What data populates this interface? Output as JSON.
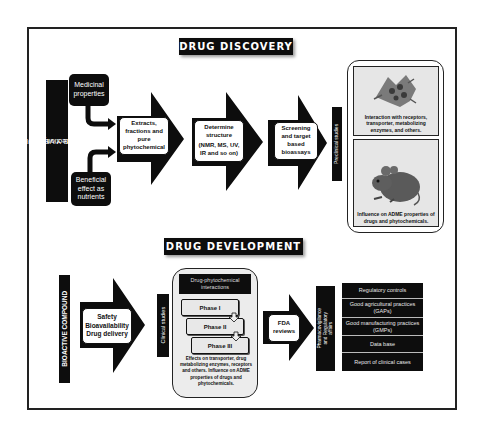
{
  "discovery": {
    "title": "DRUG DISCOVERY",
    "source_label": "FRUTAS Y VERDURAS",
    "source_sublabel": "(Selection)",
    "inputs": [
      {
        "label": "Medicinal properties"
      },
      {
        "label": "Beneficial effect as nutrients"
      }
    ],
    "steps": [
      {
        "label": "Extracts, fractions and pure phytochemical"
      },
      {
        "label": "Determine structure",
        "sublabel": "(NMR, MS, UV, IR and so on)"
      },
      {
        "label": "Screening and target based bioassays"
      }
    ],
    "preclinical_label": "Preclinical studies",
    "preclinical_cards": [
      {
        "image": "cell-micrograph",
        "caption": "Interaction with receptors, transporter, metabolizing enzymes, and others."
      },
      {
        "image": "mouse",
        "caption": "Influence on ADME properties of drugs and phytochemicals."
      }
    ]
  },
  "development": {
    "title": "DRUG DEVELOPMENT",
    "source_label": "BIOACTIVE COMPOUND",
    "first_step": {
      "lines": [
        "Safety",
        "Bioavailability",
        "Drug delivery"
      ]
    },
    "clinical_label": "Clinical studies",
    "clinical_panel": {
      "header": "Drug-phytochemical interactions",
      "phases": [
        "Phase I",
        "Phase II",
        "Phase III"
      ],
      "notes": "Effects on transporter, drug metabolizing enzymes, receptors and others. Influence on ADME properties of drugs and phytochemicals."
    },
    "review_step": {
      "label": "FDA reviews"
    },
    "regulatory_label": "Pharmacovigilance and Regulatory affairs",
    "regulatory_items": [
      "Regulatory controls",
      "Good agricultural practices (GAPs)",
      "Good manufacturing practices (GMPs)",
      "Data base",
      "Report of clinical cases"
    ]
  },
  "colors": {
    "dark": "#0d0d0d",
    "panel_gray": "#e6e6e6",
    "border": "#222222"
  }
}
